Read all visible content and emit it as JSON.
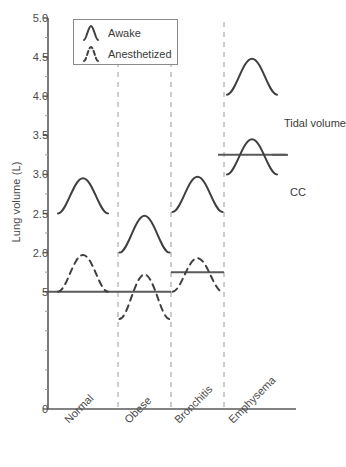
{
  "chart_data": {
    "type": "line",
    "title": "",
    "xlabel": "",
    "ylabel": "Lung volume (L)",
    "ylim": [
      0,
      5.0
    ],
    "grid": false,
    "legend_position": "top-left",
    "y_ticks": [
      {
        "label": "5.0",
        "value": 5.0
      },
      {
        "label": "4.5",
        "value": 4.5
      },
      {
        "label": "4.0",
        "value": 4.0
      },
      {
        "label": "3.5",
        "value": 3.5
      },
      {
        "label": "3.0",
        "value": 3.0
      },
      {
        "label": "2.5",
        "value": 2.5
      },
      {
        "label": "2.0",
        "value": 2.0
      },
      {
        "label": "5",
        "value": 1.5
      },
      {
        "label": "0",
        "value": 0.0
      }
    ],
    "categories": [
      "Normal",
      "Obese",
      "Bronchitis",
      "Emphysema"
    ],
    "legend": [
      {
        "label": "Awake",
        "style": "solid"
      },
      {
        "label": "Anesthetized",
        "style": "dashed"
      }
    ],
    "annotations": [
      {
        "label": "Tidal volume",
        "value": 4.1
      },
      {
        "label": "CC",
        "value": 3.25
      }
    ],
    "series": [
      {
        "name": "Awake",
        "style": "solid",
        "points": [
          {
            "category": "Normal",
            "baseline": 2.5,
            "peak": 2.95
          },
          {
            "category": "Obese",
            "baseline": 2.0,
            "peak": 2.47
          },
          {
            "category": "Bronchitis",
            "baseline": 2.52,
            "peak": 2.97
          },
          {
            "category": "Emphysema",
            "baseline": 4.02,
            "peak": 4.48
          }
        ]
      },
      {
        "name": "Anesthetized",
        "style": "dashed",
        "points": [
          {
            "category": "Normal",
            "baseline": 1.5,
            "peak": 1.97
          },
          {
            "category": "Obese",
            "baseline": 1.15,
            "peak": 1.72
          },
          {
            "category": "Bronchitis",
            "baseline": 1.5,
            "peak": 1.93
          },
          {
            "category": "Emphysema",
            "baseline": 3.0,
            "peak": 3.45,
            "style": "solid"
          }
        ]
      }
    ],
    "closing_capacity_lines": [
      {
        "category": "Normal",
        "value": 1.5
      },
      {
        "category": "Obese",
        "value": 1.5
      },
      {
        "category": "Bronchitis",
        "value": 1.75
      },
      {
        "category": "Emphysema",
        "value": 3.25
      }
    ]
  }
}
